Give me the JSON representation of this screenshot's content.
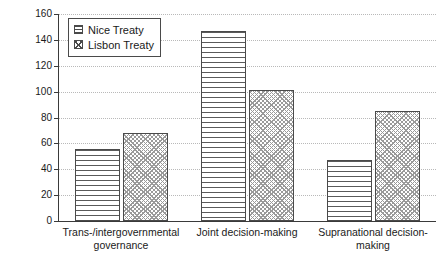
{
  "chart_data": {
    "type": "bar",
    "title": "",
    "subtitle": "",
    "xlabel": "",
    "ylabel": "",
    "categories": [
      "Trans-/intergovernmental governance",
      "Joint decision-making",
      "Supranational decision-making"
    ],
    "category_lines": [
      [
        "Trans-/intergovernmental",
        "governance"
      ],
      [
        "Joint decision-making"
      ],
      [
        "Supranational decision-making"
      ]
    ],
    "series": [
      {
        "name": "Nice Treaty",
        "values": [
          56,
          147,
          47
        ],
        "pattern": "horizontal-lines"
      },
      {
        "name": "Lisbon Treaty",
        "values": [
          68,
          101,
          85
        ],
        "pattern": "checkered"
      }
    ],
    "ylim": [
      0,
      160
    ],
    "ytick_step": 20,
    "ytick_labels": [
      "160",
      "140",
      "120",
      "100",
      "80",
      "60",
      "40",
      "20",
      "0"
    ],
    "ytick_values": [
      160,
      140,
      120,
      100,
      80,
      60,
      40,
      20,
      0
    ],
    "grid": true,
    "grid_style": "dotted-horizontal",
    "legend_position": "top-left",
    "legend_entries": [
      "Nice Treaty",
      "Lisbon Treaty"
    ],
    "colors": {
      "axis": "#3a3a3a",
      "gridline": "#b9b9b9",
      "bar_outline": "#4a4a4a",
      "bar_fill": "#ffffff",
      "text": "#1a1a1a",
      "background": "#ffffff"
    }
  }
}
